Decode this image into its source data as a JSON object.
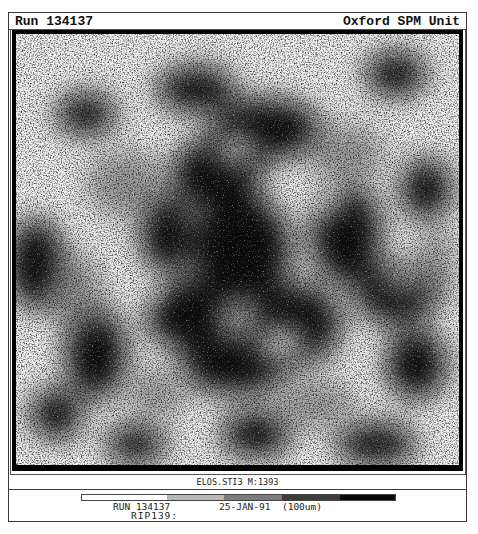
{
  "header": {
    "run_label": "Run 134137",
    "unit_label": "Oxford SPM Unit"
  },
  "image": {
    "description": "SIMS / scanning proton microprobe intensity map, speckled greyscale",
    "caption": "ELOS.STI3 M:1393"
  },
  "colorbar": {
    "segments": [
      {
        "level": "white",
        "color": "#ffffff",
        "width": 85
      },
      {
        "level": "light-gray",
        "color": "#b8b8b8",
        "width": 57
      },
      {
        "level": "mid-gray",
        "color": "#7c7c7c",
        "width": 58
      },
      {
        "level": "dark-gray",
        "color": "#3c3c3c",
        "width": 58
      },
      {
        "level": "black",
        "color": "#0a0a0a",
        "width": 57
      }
    ]
  },
  "footer": {
    "run": "RUN 134137",
    "date": "25-JAN-91",
    "scale": "(100um)",
    "rip": "RIP139:"
  }
}
